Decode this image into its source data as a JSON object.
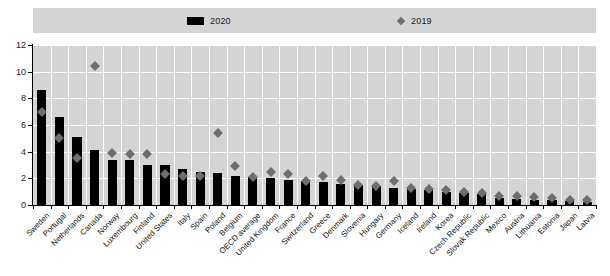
{
  "legend": {
    "items": [
      {
        "label": "2020",
        "marker": "bar-swatch-icon",
        "color": "#000000"
      },
      {
        "label": "2019",
        "marker": "diamond-swatch-icon",
        "color": "#6e6e6e"
      }
    ]
  },
  "chart_data": {
    "type": "bar",
    "title": "",
    "subtitle": "",
    "xlabel": "",
    "ylabel": "",
    "ylim": [
      0,
      12
    ],
    "yticks": [
      0,
      2,
      4,
      6,
      8,
      10,
      12
    ],
    "grid": true,
    "legend_position": "top",
    "categories": [
      "Sweden",
      "Portugal",
      "Netherlands",
      "Canada",
      "Norway",
      "Luxembourg",
      "Finland",
      "United States",
      "Italy",
      "Spain",
      "Poland",
      "Belgium",
      "OECD average",
      "United Kingdom",
      "France",
      "Switzerland",
      "Greece",
      "Denmark",
      "Slovenia",
      "Hungary",
      "Germany",
      "Iceland",
      "Ireland",
      "Korea",
      "Czech Republic",
      "Slovak Republic",
      "Mexico",
      "Austria",
      "Lithuania",
      "Estonia",
      "Japan",
      "Latvia"
    ],
    "series": [
      {
        "name": "2020",
        "type": "bar",
        "color": "#000000",
        "values": [
          8.6,
          6.6,
          5.1,
          4.1,
          3.4,
          3.4,
          3.0,
          3.0,
          2.7,
          2.5,
          2.4,
          2.2,
          2.1,
          2.0,
          1.9,
          1.8,
          1.7,
          1.6,
          1.5,
          1.4,
          1.3,
          1.2,
          1.1,
          1.0,
          0.9,
          0.85,
          0.5,
          0.45,
          0.4,
          0.35,
          0.3,
          0.25
        ]
      },
      {
        "name": "2019",
        "type": "scatter",
        "color": "#6e6e6e",
        "values": [
          7.0,
          5.0,
          3.5,
          10.4,
          3.9,
          3.8,
          3.8,
          2.3,
          2.2,
          2.2,
          5.4,
          2.9,
          2.1,
          2.5,
          2.3,
          1.8,
          2.2,
          1.9,
          1.5,
          1.4,
          1.8,
          1.3,
          1.2,
          1.1,
          1.0,
          0.9,
          0.7,
          0.7,
          0.6,
          0.5,
          0.4,
          0.4
        ]
      }
    ]
  }
}
